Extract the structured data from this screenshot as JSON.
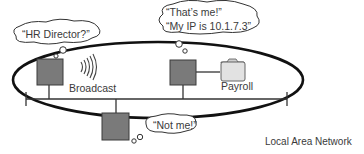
{
  "diagram": {
    "type": "network-broadcast",
    "network_label": "Local Area Network",
    "broadcast_label": "Broadcast",
    "server_label": "Payroll",
    "bubbles": {
      "sender": "“HR Director?”",
      "responder_line1": "“That’s me!”",
      "responder_line2": "“My IP is 10.1.7.3”",
      "other": "“Not me!”"
    },
    "nodes": [
      {
        "id": "sender",
        "role": "broadcasting host"
      },
      {
        "id": "responder",
        "role": "HR Director host",
        "ip": "10.1.7.3"
      },
      {
        "id": "other",
        "role": "non-matching host"
      },
      {
        "id": "payroll",
        "role": "folder / server"
      }
    ],
    "colors": {
      "node_fill": "#7a7a7a",
      "node_stroke": "#3a3a3a",
      "line": "#2a2a2a",
      "ellipse": "#111111",
      "folder_fill": "#e2e2e2",
      "text": "#3a3a3a"
    }
  }
}
